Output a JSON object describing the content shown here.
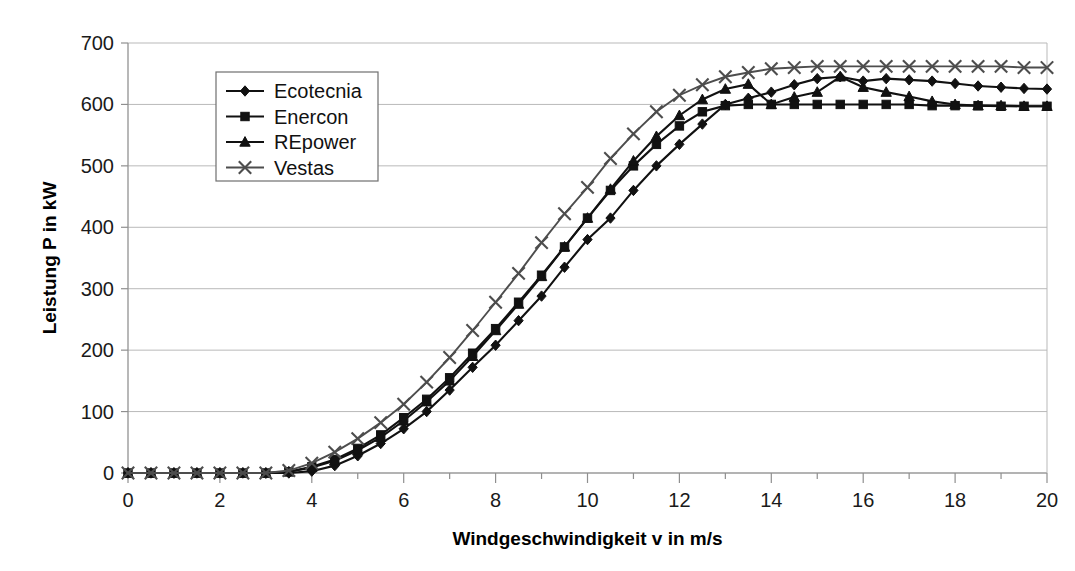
{
  "chart_data": {
    "type": "line",
    "title": "",
    "xlabel": "Windgeschwindigkeit v in m/s",
    "ylabel": "Leistung P in kW",
    "xlim": [
      0,
      20
    ],
    "ylim": [
      0,
      700
    ],
    "xticks": [
      0,
      2,
      4,
      6,
      8,
      10,
      12,
      14,
      16,
      18,
      20
    ],
    "xtick_labels": [
      "0",
      "2",
      "4",
      "6",
      "8",
      "10",
      "12",
      "14",
      "16",
      "18",
      "20"
    ],
    "yticks": [
      0,
      100,
      200,
      300,
      400,
      500,
      600,
      700
    ],
    "ytick_labels": [
      "0",
      "100",
      "200",
      "300",
      "400",
      "500",
      "600",
      "700"
    ],
    "x_minor_step": 1,
    "grid": "horizontal",
    "legend_position": "upper-left-inside",
    "x": [
      0,
      0.5,
      1,
      1.5,
      2,
      2.5,
      3,
      3.5,
      4,
      4.5,
      5,
      5.5,
      6,
      6.5,
      7,
      7.5,
      8,
      8.5,
      9,
      9.5,
      10,
      10.5,
      11,
      11.5,
      12,
      12.5,
      13,
      13.5,
      14,
      14.5,
      15,
      15.5,
      16,
      16.5,
      17,
      17.5,
      18,
      18.5,
      19,
      19.5,
      20
    ],
    "series": [
      {
        "name": "Ecotecnia",
        "marker": "diamond",
        "color": "#111111",
        "values": [
          0,
          0,
          0,
          0,
          0,
          0,
          0,
          0,
          3,
          12,
          28,
          48,
          72,
          100,
          135,
          172,
          208,
          248,
          288,
          335,
          380,
          415,
          460,
          500,
          535,
          568,
          600,
          610,
          620,
          632,
          642,
          645,
          638,
          642,
          640,
          638,
          634,
          630,
          628,
          626,
          625
        ]
      },
      {
        "name": "Enercon",
        "marker": "square",
        "color": "#111111",
        "values": [
          0,
          0,
          0,
          0,
          0,
          0,
          0,
          2,
          10,
          22,
          40,
          62,
          90,
          120,
          155,
          195,
          235,
          278,
          322,
          368,
          415,
          460,
          500,
          535,
          565,
          588,
          598,
          600,
          600,
          600,
          600,
          600,
          600,
          600,
          600,
          598,
          598,
          598,
          597,
          597,
          597
        ]
      },
      {
        "name": "REpower",
        "marker": "triangle",
        "color": "#111111",
        "values": [
          0,
          0,
          0,
          0,
          0,
          0,
          0,
          2,
          9,
          20,
          37,
          58,
          85,
          116,
          150,
          190,
          232,
          275,
          320,
          368,
          415,
          462,
          508,
          548,
          582,
          608,
          625,
          633,
          600,
          612,
          620,
          645,
          628,
          620,
          613,
          605,
          600,
          598,
          598,
          597,
          597
        ]
      },
      {
        "name": "Vestas",
        "marker": "cross",
        "color": "#4d4d4d",
        "values": [
          0,
          0,
          0,
          0,
          0,
          0,
          0,
          4,
          16,
          34,
          56,
          82,
          112,
          148,
          188,
          232,
          278,
          325,
          375,
          422,
          465,
          512,
          552,
          588,
          615,
          632,
          645,
          652,
          658,
          660,
          662,
          662,
          662,
          662,
          662,
          662,
          662,
          662,
          662,
          660,
          660
        ]
      }
    ]
  },
  "legend": {
    "items": [
      {
        "label": "Ecotecnia"
      },
      {
        "label": "Enercon"
      },
      {
        "label": "REpower"
      },
      {
        "label": "Vestas"
      }
    ]
  }
}
